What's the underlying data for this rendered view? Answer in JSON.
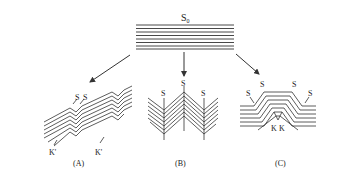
{
  "diagram": {
    "top_stack": {
      "label": "S",
      "subscript": "0"
    },
    "panels": [
      {
        "id": "A",
        "caption": "(A)",
        "labels": [
          "S",
          "S",
          "K'",
          "K'"
        ]
      },
      {
        "id": "B",
        "caption": "(B)",
        "labels": [
          "S",
          "S",
          "S"
        ]
      },
      {
        "id": "C",
        "caption": "(C)",
        "labels": [
          "S",
          "S",
          "S",
          "S",
          "K",
          "K"
        ]
      }
    ],
    "colors": {
      "ink": "#333333",
      "background": "#ffffff"
    }
  }
}
